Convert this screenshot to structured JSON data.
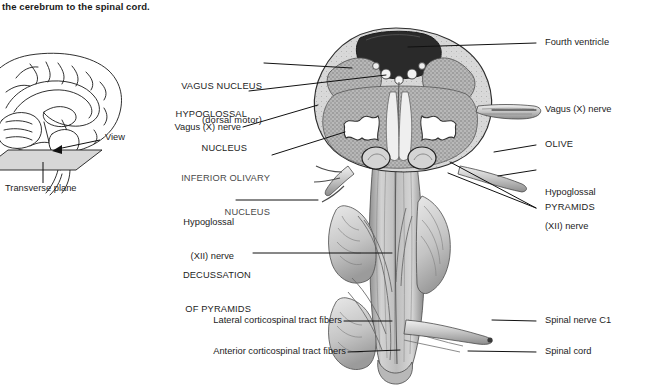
{
  "caption": {
    "text": "the cerebrum to the spinal cord."
  },
  "inset": {
    "view_label": "View",
    "plane_label": "Transverse plane"
  },
  "labels_left": [
    {
      "name": "vagus-nucleus",
      "line1": "VAGUS NUCLEUS",
      "line2": "(dorsal motor)",
      "style": "caps"
    },
    {
      "name": "hypoglossal-nucleus",
      "line1": "HYPOGLOSSAL",
      "line2": "NUCLEUS",
      "style": "caps"
    },
    {
      "name": "vagus-x-nerve",
      "line1": "Vagus (X) nerve",
      "line2": "",
      "style": "normal"
    },
    {
      "name": "inferior-olivary-nucleus",
      "line1": "INFERIOR OLIVARY",
      "line2": "NUCLEUS",
      "style": "caps-faded"
    },
    {
      "name": "hypoglossal-xii-nerve",
      "line1": "Hypoglossal",
      "line2": "(XII) nerve",
      "style": "normal"
    },
    {
      "name": "decussation-of-pyramids",
      "line1": "DECUSSATION",
      "line2": "OF PYRAMIDS",
      "style": "caps"
    },
    {
      "name": "lateral-corticospinal-tract-fibers",
      "line1": "Lateral corticospinal tract fibers",
      "line2": "",
      "style": "normal"
    },
    {
      "name": "anterior-corticospinal-tract-fibers",
      "line1": "Anterior corticospinal tract fibers",
      "line2": "",
      "style": "normal"
    }
  ],
  "labels_right": [
    {
      "name": "fourth-ventricle",
      "line1": "Fourth ventricle",
      "line2": "",
      "style": "normal"
    },
    {
      "name": "vagus-x-nerve-right",
      "line1": "Vagus (X) nerve",
      "line2": "",
      "style": "normal"
    },
    {
      "name": "olive",
      "line1": "OLIVE",
      "line2": "",
      "style": "caps"
    },
    {
      "name": "hypoglossal-xii-nerve-right",
      "line1": "Hypoglossal",
      "line2": "(XII) nerve",
      "style": "normal"
    },
    {
      "name": "pyramids",
      "line1": "PYRAMIDS",
      "line2": "",
      "style": "caps"
    },
    {
      "name": "spinal-nerve-c1",
      "line1": "Spinal nerve C1",
      "line2": "",
      "style": "normal"
    },
    {
      "name": "spinal-cord",
      "line1": "Spinal cord",
      "line2": "",
      "style": "normal"
    }
  ],
  "colors": {
    "ink": "#111111",
    "text": "#1c1c1c",
    "background": "#ffffff"
  }
}
